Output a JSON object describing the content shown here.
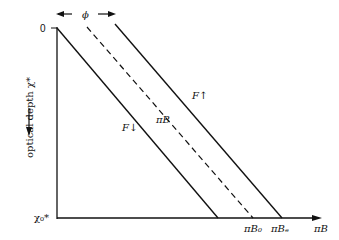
{
  "diagram": {
    "phi_label": "ϕ",
    "y_axis": {
      "label": "optical depth χ*",
      "top_tick": "0",
      "bottom_tick": "χ₀*"
    },
    "x_axis": {
      "label": "πB",
      "ticks": [
        "πB₀",
        "πBₑ"
      ]
    },
    "lines": [
      {
        "label": "F↓",
        "style": "solid"
      },
      {
        "label": "πB",
        "style": "dashed"
      },
      {
        "label": "F↑",
        "style": "solid"
      }
    ]
  }
}
